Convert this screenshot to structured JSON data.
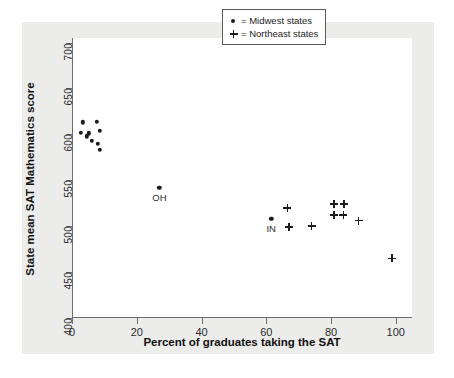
{
  "chart_data": {
    "type": "scatter",
    "title": "",
    "xlabel": "Percent of graduates taking the SAT",
    "ylabel": "State mean SAT Mathematics score",
    "xlim": [
      0,
      105
    ],
    "ylim": [
      400,
      705
    ],
    "xticks": [
      0,
      20,
      40,
      60,
      80,
      100
    ],
    "yticks": [
      400,
      450,
      500,
      550,
      600,
      650,
      700
    ],
    "grid": false,
    "legend_position": "top-right",
    "legend": [
      {
        "symbol": "dot",
        "label": "= Midwest states"
      },
      {
        "symbol": "plus",
        "label": "= Northeast states"
      }
    ],
    "series": [
      {
        "name": "Midwest states",
        "marker": "dot",
        "points": [
          {
            "x": 3.4,
            "y": 613
          },
          {
            "x": 7.7,
            "y": 614
          },
          {
            "x": 2.8,
            "y": 602
          },
          {
            "x": 5.2,
            "y": 601
          },
          {
            "x": 8.6,
            "y": 604
          },
          {
            "x": 4.6,
            "y": 598
          },
          {
            "x": 6.2,
            "y": 593
          },
          {
            "x": 8.0,
            "y": 590
          },
          {
            "x": 8.6,
            "y": 583
          },
          {
            "x": 27.0,
            "y": 542
          },
          {
            "x": 61.5,
            "y": 508
          }
        ]
      },
      {
        "name": "Northeast states",
        "marker": "plus",
        "points": [
          {
            "x": 66.5,
            "y": 520
          },
          {
            "x": 67.0,
            "y": 499
          },
          {
            "x": 74.0,
            "y": 500
          },
          {
            "x": 81.0,
            "y": 524
          },
          {
            "x": 84.0,
            "y": 524
          },
          {
            "x": 81.0,
            "y": 512
          },
          {
            "x": 83.8,
            "y": 512
          },
          {
            "x": 88.5,
            "y": 506
          },
          {
            "x": 98.8,
            "y": 465
          }
        ]
      }
    ],
    "point_labels": [
      {
        "text": "OH",
        "x": 27.0,
        "y": 542
      },
      {
        "text": "IN",
        "x": 61.5,
        "y": 508
      }
    ],
    "colors": {
      "marker": "#1c1c1c",
      "axis": "#6d6d6d",
      "plot_background": "#ffffff",
      "panel_background": "#ececeb",
      "legend_border": "#5a5a5a"
    }
  }
}
